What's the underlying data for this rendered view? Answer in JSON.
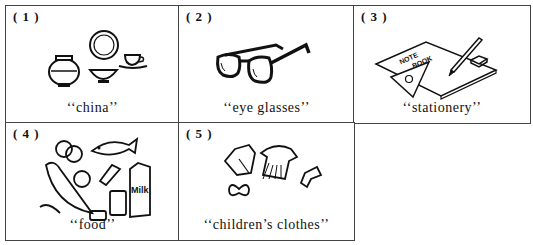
{
  "panels": [
    {
      "number": "( 1 )",
      "caption": "‘‘china’’",
      "icon": "china-dishes-icon"
    },
    {
      "number": "( 2 )",
      "caption": "‘‘eye  glasses’’",
      "icon": "eyeglasses-icon"
    },
    {
      "number": "( 3 )",
      "caption": "‘‘stationery’’",
      "icon": "stationery-icon",
      "notebook_text": [
        "NOTE",
        "BOOK"
      ]
    },
    {
      "number": "( 4 )",
      "caption": "‘‘food’’",
      "icon": "food-icon",
      "carton_text": "Milk"
    },
    {
      "number": "( 5 )",
      "caption": "‘‘children’s  clothes’’",
      "icon": "childrens-clothes-icon"
    }
  ]
}
